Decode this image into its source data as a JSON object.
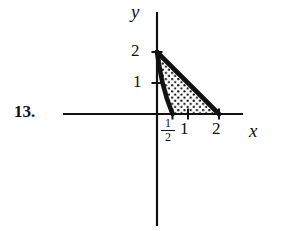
{
  "problem": {
    "number_label": "13."
  },
  "figure": {
    "axes": {
      "x_label": "x",
      "y_label": "y",
      "origin_px": {
        "x": 157,
        "y": 114
      },
      "unit_px": {
        "x": 31,
        "y": 31
      },
      "x_axis_extent_px": {
        "start": 63,
        "end": 243
      },
      "y_axis_extent_px": {
        "start": 12,
        "end": 226
      }
    },
    "ticks": {
      "x": [
        {
          "label": "1",
          "value": 1
        },
        {
          "label": "2",
          "value": 2
        }
      ],
      "x_fraction": {
        "numerator": "1",
        "denominator": "2",
        "value": 0.5
      },
      "y": [
        {
          "label": "1",
          "value": 1
        },
        {
          "label": "2",
          "value": 2
        }
      ]
    },
    "region": {
      "description": "shaded-region",
      "fill_pattern": "stipple-dots",
      "boundary_color": "#111111",
      "fill_dot_color": "#111111",
      "vertices": [
        {
          "x": 0,
          "y": 2
        },
        {
          "x": 0.5,
          "y": 0
        },
        {
          "x": 2,
          "y": 0
        }
      ],
      "edges": [
        {
          "name": "left-curve",
          "from": [
            0,
            2
          ],
          "to": [
            0.5,
            0
          ],
          "style": "curved-thick"
        },
        {
          "name": "bottom-edge",
          "from": [
            0.5,
            0
          ],
          "to": [
            2,
            0
          ],
          "style": "on-x-axis"
        },
        {
          "name": "hypotenuse",
          "from": [
            2,
            0
          ],
          "to": [
            0,
            2
          ],
          "style": "straight-thick"
        }
      ]
    }
  },
  "colors": {
    "background": "#ffffff",
    "ink": "#111111"
  }
}
